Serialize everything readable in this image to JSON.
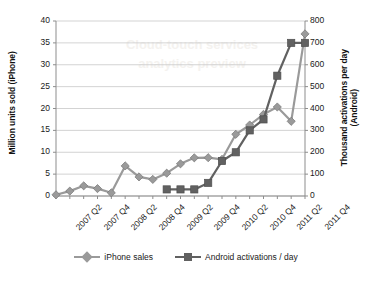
{
  "chart_data": {
    "type": "line",
    "title": "",
    "xlabel": "",
    "ylabel": "Million units sold (iPhone)",
    "ylabel_right": "Thousand activations per day (Android)",
    "ylim": [
      0,
      40
    ],
    "ylim_right": [
      0,
      800
    ],
    "yticks": [
      "0",
      "5",
      "10",
      "15",
      "20",
      "25",
      "30",
      "35",
      "40"
    ],
    "yticks_right": [
      "0",
      "100",
      "200",
      "300",
      "400",
      "500",
      "600",
      "700",
      "800"
    ],
    "grid": "horizontal",
    "legend_position": "bottom",
    "x": [
      "2007 Q2",
      "2007 Q3",
      "2007 Q4",
      "2008 Q1",
      "2008 Q2",
      "2008 Q3",
      "2008 Q4",
      "2009 Q1",
      "2009 Q2",
      "2009 Q3",
      "2009 Q4",
      "2010 Q1",
      "2010 Q2",
      "2010 Q3",
      "2010 Q4",
      "2011 Q1",
      "2011 Q2",
      "2011 Q3",
      "2011 Q4"
    ],
    "xtick_labels": [
      "2007 Q2",
      "2007 Q4",
      "2008 Q2",
      "2008 Q4",
      "2009 Q2",
      "2009 Q4",
      "2010 Q2",
      "2010 Q4",
      "2011 Q2",
      "2011 Q4"
    ],
    "series": [
      {
        "name": "iPhone sales",
        "axis": "left",
        "unit": "Million units sold",
        "color": "#9a9a9a",
        "marker": "diamond",
        "values": [
          0.27,
          1.12,
          2.32,
          1.7,
          0.72,
          6.89,
          4.36,
          3.79,
          5.21,
          7.37,
          8.74,
          8.75,
          8.4,
          14.1,
          16.24,
          18.65,
          20.34,
          17.07,
          37.04
        ]
      },
      {
        "name": "Android activations / day",
        "axis": "right",
        "unit": "Thousand activations per day",
        "color": "#616161",
        "marker": "square",
        "values": [
          null,
          null,
          null,
          null,
          null,
          null,
          null,
          null,
          30,
          30,
          30,
          60,
          160,
          200,
          300,
          350,
          550,
          700,
          700
        ]
      }
    ]
  },
  "legend": {
    "items": [
      {
        "label": "iPhone sales",
        "color": "#9a9a9a",
        "marker": "diamond"
      },
      {
        "label": "Android activations / day",
        "color": "#616161",
        "marker": "square"
      }
    ]
  },
  "watermark": {
    "line1": "Cloud-touch services",
    "line2": "analytics preview"
  }
}
